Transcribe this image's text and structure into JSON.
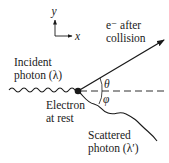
{
  "diagram": {
    "axes": {
      "x_label": "x",
      "y_label": "y"
    },
    "labels": {
      "electron_after_line1": "e⁻ after",
      "electron_after_line2": "collision",
      "incident_line1": "Incident",
      "incident_line2": "photon (λ)",
      "electron_rest_line1": "Electron",
      "electron_rest_line2": "at rest",
      "scattered_line1": "Scattered",
      "scattered_line2": "photon (λ′)",
      "theta": "θ",
      "phi": "φ"
    },
    "colors": {
      "ink": "#1a1a1a",
      "background": "#ffffff"
    }
  }
}
